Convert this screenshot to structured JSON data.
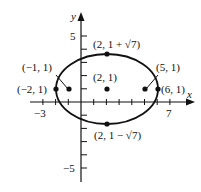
{
  "chart_data": {
    "type": "scatter",
    "title": "",
    "xlabel": "x",
    "ylabel": "y",
    "xlim": [
      -3.5,
      8.5
    ],
    "ylim": [
      -6,
      6.5
    ],
    "grid": false,
    "x_ticks": [
      -3,
      -2,
      -1,
      1,
      2,
      3,
      4,
      5,
      6,
      7
    ],
    "x_tick_labels": [
      {
        "value": -3,
        "label": "−3"
      },
      {
        "value": 7,
        "label": "7"
      }
    ],
    "y_ticks": [
      -5,
      -4,
      -3,
      -2,
      -1,
      1,
      2,
      3,
      4,
      5
    ],
    "y_tick_labels": [
      {
        "value": 5,
        "label": "5"
      },
      {
        "value": -5,
        "label": "−5"
      }
    ],
    "curve": {
      "kind": "ellipse",
      "center": [
        2,
        1
      ],
      "semi_axis_x": 4,
      "semi_axis_y": 2.6458,
      "equation": "(x-2)^2/16 + (y-1)^2/7 = 1"
    },
    "points": [
      {
        "x": 2,
        "y": 3.6458,
        "label": "(2, 1 + √7)"
      },
      {
        "x": 2,
        "y": -1.6458,
        "label": "(2, 1 − √7)"
      },
      {
        "x": 2,
        "y": 1,
        "label": "(2, 1)"
      },
      {
        "x": -2,
        "y": 1,
        "label": "(−2, 1)"
      },
      {
        "x": 6,
        "y": 1,
        "label": "(6, 1)"
      },
      {
        "x": -1,
        "y": 1,
        "label": "(−1, 1)"
      },
      {
        "x": 5,
        "y": 1,
        "label": "(5, 1)"
      }
    ]
  },
  "labels": {
    "x_axis": "x",
    "y_axis": "y",
    "tick_neg3": "−3",
    "tick_7": "7",
    "tick_5": "5",
    "tick_neg5": "−5",
    "top_vertex": "(2, 1 + √7)",
    "bottom_vertex": "(2, 1 − √7)",
    "center": "(2, 1)",
    "left_vertex": "(−2, 1)",
    "right_vertex": "(6, 1)",
    "left_focus": "(−1, 1)",
    "right_focus": "(5, 1)"
  },
  "colors": {
    "ink": "#111111",
    "background": "#ffffff"
  }
}
